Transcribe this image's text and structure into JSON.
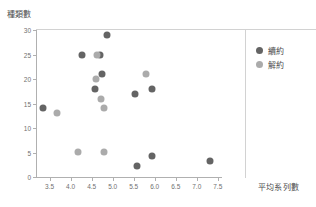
{
  "chart_data": {
    "type": "scatter",
    "title": "",
    "xlabel": "平均系列數",
    "ylabel": "種類數",
    "xlim": [
      3.2,
      7.6
    ],
    "ylim": [
      0,
      30
    ],
    "xticks": [
      "3.5",
      "4.0",
      "4.5",
      "5.0",
      "5.5",
      "6.0",
      "6.5",
      "7.0",
      "7.5"
    ],
    "xtick_values": [
      3.5,
      4.0,
      4.5,
      5.0,
      5.5,
      6.0,
      6.5,
      7.0,
      7.5
    ],
    "yticks": [
      "0",
      "5",
      "10",
      "15",
      "20",
      "25",
      "30"
    ],
    "ytick_values": [
      0,
      5,
      10,
      15,
      20,
      25,
      30
    ],
    "grid": false,
    "legend_position": "right",
    "series": [
      {
        "name": "續約",
        "color": "#646464",
        "points": [
          {
            "x": 3.35,
            "y": 14
          },
          {
            "x": 4.28,
            "y": 25
          },
          {
            "x": 4.7,
            "y": 25
          },
          {
            "x": 4.86,
            "y": 29
          },
          {
            "x": 4.74,
            "y": 21
          },
          {
            "x": 4.57,
            "y": 18
          },
          {
            "x": 5.52,
            "y": 17
          },
          {
            "x": 5.93,
            "y": 18
          },
          {
            "x": 5.58,
            "y": 2.3
          },
          {
            "x": 5.93,
            "y": 4.2
          },
          {
            "x": 7.32,
            "y": 3.3
          }
        ]
      },
      {
        "name": "解約",
        "color": "#ababab",
        "points": [
          {
            "x": 3.67,
            "y": 13
          },
          {
            "x": 4.63,
            "y": 25
          },
          {
            "x": 4.6,
            "y": 20
          },
          {
            "x": 4.72,
            "y": 16
          },
          {
            "x": 4.8,
            "y": 14
          },
          {
            "x": 5.8,
            "y": 21
          },
          {
            "x": 4.18,
            "y": 5.1
          },
          {
            "x": 4.8,
            "y": 5.1
          }
        ]
      }
    ]
  },
  "legend": {
    "items": [
      {
        "label": "續約",
        "color": "#646464"
      },
      {
        "label": "解約",
        "color": "#ababab"
      }
    ]
  }
}
